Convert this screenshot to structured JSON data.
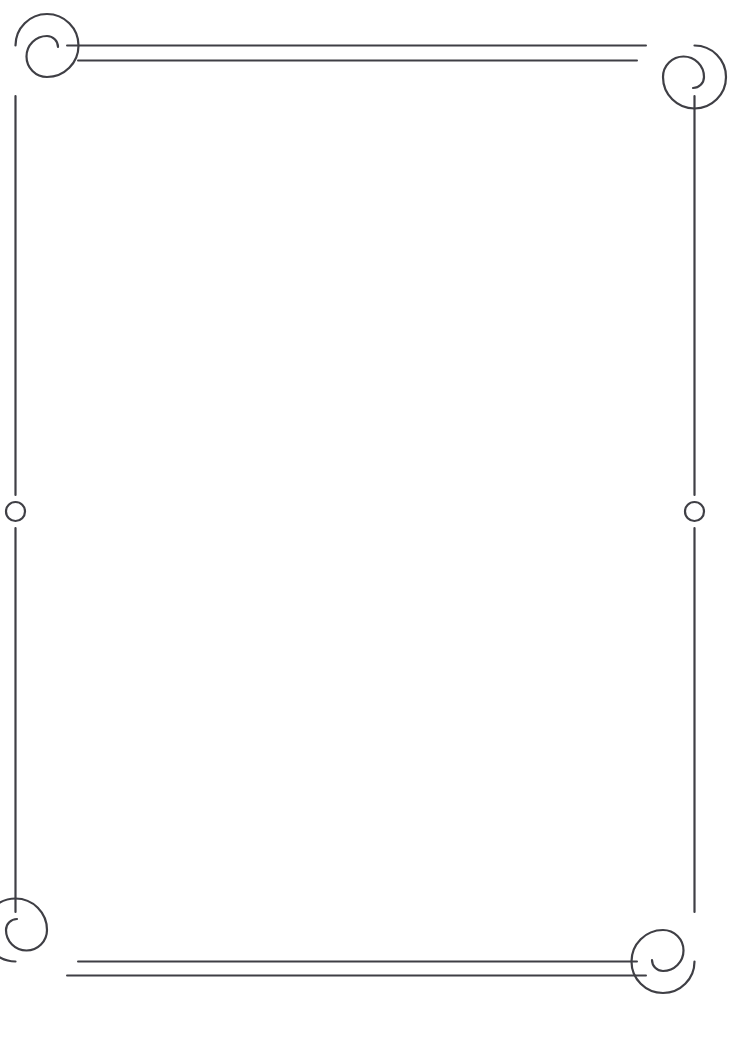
{
  "document": {
    "kind": "decorative-certificate-border",
    "title": "",
    "body_text": "",
    "background_color": "#ffffff",
    "ink_color": "#3f3f45"
  },
  "frame": {
    "name": "ornamental-scroll-border",
    "stroke_color": "#3f3f45",
    "stroke_width": 2.2,
    "rule_stroke_width": 2.0,
    "geometry": {
      "left_rail_x": 15.5,
      "right_rail_x": 694.5,
      "top_rail_y": 45.5,
      "bottom_rail_y": 961.5,
      "rail_top_start_y": 78,
      "rail_bottom_end_y": 929,
      "spiral_radius": 32,
      "spiral_inner_radius": 12
    },
    "corners": [
      {
        "name": "corner-top-left",
        "x": 47,
        "y": 77,
        "rotation": 0
      },
      {
        "name": "corner-top-right",
        "x": 663,
        "y": 77,
        "rotation": 90
      },
      {
        "name": "corner-bottom-right",
        "x": 663,
        "y": 930,
        "rotation": 180
      },
      {
        "name": "corner-bottom-left",
        "x": 47,
        "y": 930,
        "rotation": 270
      }
    ],
    "double_rules": [
      {
        "name": "rule-top-outer",
        "x1": 67,
        "y1": 45.5,
        "x2": 646,
        "y2": 45.5
      },
      {
        "name": "rule-top-inner",
        "x1": 78,
        "y1": 60.5,
        "x2": 637,
        "y2": 60.5
      },
      {
        "name": "rule-bottom-inner",
        "x1": 78,
        "y1": 961.5,
        "x2": 637,
        "y2": 961.5
      },
      {
        "name": "rule-bottom-outer",
        "x1": 67,
        "y1": 975.5,
        "x2": 646,
        "y2": 975.5
      }
    ],
    "side_rails": [
      {
        "name": "rail-left-upper",
        "x": 15.5,
        "y1": 96,
        "y2": 495
      },
      {
        "name": "rail-left-lower",
        "x": 15.5,
        "y1": 528,
        "y2": 912
      },
      {
        "name": "rail-right-upper",
        "x": 694.5,
        "y1": 96,
        "y2": 495
      },
      {
        "name": "rail-right-lower",
        "x": 694.5,
        "y1": 528,
        "y2": 912
      }
    ],
    "medallions": [
      {
        "name": "medallion-left",
        "cx": 15.5,
        "cy": 511.5,
        "r": 9.5
      },
      {
        "name": "medallion-right",
        "cx": 694.5,
        "cy": 511.5,
        "r": 9.5
      }
    ]
  }
}
